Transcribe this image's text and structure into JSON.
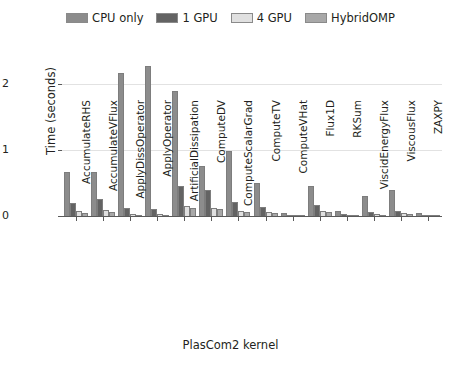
{
  "chart_data": {
    "type": "bar",
    "title": "",
    "xlabel": "PlasCom2 kernel",
    "ylabel": "Time (seconds)",
    "ylim": [
      0,
      2.35
    ],
    "yticks": [
      0,
      1,
      2
    ],
    "ytick_labels": [
      "0",
      "1",
      "2"
    ],
    "grid": true,
    "legend_position": "top-center",
    "categories": [
      "AccumulateRHS",
      "AccumulateVFlux",
      "ApplyDissOperator",
      "ApplyOperator",
      "ArtificialDissipation",
      "ComputeDV",
      "ComputeScalarGrad",
      "ComputeTV",
      "ComputeVHat",
      "Flux1D",
      "RKSum",
      "ViscidEnergyFlux",
      "ViscousFlux",
      "ZAXPY"
    ],
    "series": [
      {
        "name": "CPU only",
        "color": "#8c8c8c",
        "values": [
          0.66,
          0.66,
          2.17,
          2.28,
          1.89,
          0.76,
          0.99,
          0.5,
          0.04,
          0.45,
          0.08,
          0.31,
          0.4,
          0.05
        ]
      },
      {
        "name": "1 GPU",
        "color": "#636363",
        "values": [
          0.19,
          0.26,
          0.12,
          0.11,
          0.45,
          0.4,
          0.21,
          0.13,
          0.02,
          0.17,
          0.03,
          0.06,
          0.08,
          0.02
        ]
      },
      {
        "name": "4 GPU",
        "color": "#e0e0e0",
        "values": [
          0.07,
          0.09,
          0.03,
          0.03,
          0.15,
          0.12,
          0.07,
          0.06,
          0.01,
          0.08,
          0.02,
          0.03,
          0.04,
          0.01
        ]
      },
      {
        "name": "HybridOMP",
        "color": "#a8a8a8",
        "values": [
          0.05,
          0.06,
          0.02,
          0.02,
          0.12,
          0.1,
          0.06,
          0.04,
          0.01,
          0.06,
          0.01,
          0.02,
          0.03,
          0.01
        ]
      }
    ]
  },
  "legend": {
    "entries": [
      {
        "label": "CPU only",
        "color": "#8c8c8c"
      },
      {
        "label": "1 GPU",
        "color": "#636363"
      },
      {
        "label": "4 GPU",
        "color": "#e0e0e0"
      },
      {
        "label": "HybridOMP",
        "color": "#a8a8a8"
      }
    ]
  }
}
